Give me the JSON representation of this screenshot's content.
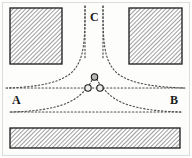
{
  "figure": {
    "title": "",
    "background_color": "#fdfdfc",
    "border_color": "#d8d8d4",
    "labels": {
      "left": "A",
      "right": "B",
      "top": "C"
    },
    "hatch": {
      "fill_color": "#ffffff",
      "line_color": "#707070",
      "edge_color": "#1a1a1a",
      "angle_deg": 45,
      "spacing_px": 3
    },
    "curve": {
      "color": "#4a4a4a",
      "style": "dotted",
      "dash_pattern": "1.4 2.2",
      "width_px": 1.1
    },
    "marker": {
      "fill_color": "#b5b5b5",
      "edge_color": "#1a1a1a",
      "radius_px": 3.2
    },
    "regions": [
      {
        "name": "top-left-electrode",
        "x": 10,
        "y": 8,
        "width": 52,
        "height": 56,
        "role": "hatched-conductor"
      },
      {
        "name": "top-right-electrode",
        "x": 129,
        "y": 8,
        "width": 53,
        "height": 56,
        "role": "hatched-conductor"
      },
      {
        "name": "bottom-plate",
        "x": 10,
        "y": 128,
        "width": 170,
        "height": 20,
        "role": "hatched-conductor"
      }
    ],
    "asymptote_lines": [
      {
        "name": "line-AB-upper",
        "y": 88,
        "x_start": 6,
        "x_end": 186,
        "label_left": "A",
        "label_right": "B"
      },
      {
        "name": "line-AB-lower",
        "y": 112,
        "x_start": 10,
        "x_end": 182,
        "label_left": "",
        "label_right": ""
      }
    ],
    "vertical_asymptotes": [
      {
        "name": "vertical-left",
        "x": 85,
        "y_start": 6,
        "y_end": 64
      },
      {
        "name": "vertical-right",
        "x": 103,
        "y_start": 6,
        "y_end": 64
      }
    ],
    "markers": [
      {
        "name": "saddle-point-upper",
        "x": 94,
        "y": 77,
        "label": ""
      },
      {
        "name": "saddle-point-left",
        "x": 88,
        "y": 88,
        "label": ""
      },
      {
        "name": "saddle-point-right",
        "x": 100,
        "y": 88,
        "label": ""
      }
    ],
    "field_curves": [
      {
        "name": "curve-left-branch",
        "description": "hyperbolic branch descending from vertical-left asymptote to horizontal line A"
      },
      {
        "name": "curve-right-branch",
        "description": "hyperbolic branch descending from vertical-right asymptote to horizontal line B"
      },
      {
        "name": "curve-lower-left",
        "description": "hyperbolic branch rising from lower line on the left toward the centre"
      },
      {
        "name": "curve-lower-right",
        "description": "hyperbolic branch rising from lower line on the right toward the centre"
      }
    ]
  }
}
